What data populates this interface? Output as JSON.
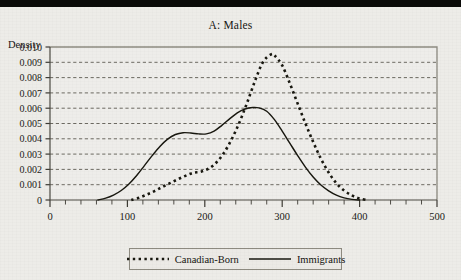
{
  "figure": {
    "title": "A: Males",
    "panel_label": "A",
    "panel_name": "Males",
    "background_color": "#edece8",
    "frame_color": "#8d8a80"
  },
  "axes": {
    "y_axis_title": "Density",
    "x_axis_title": "",
    "y_ticks": [
      "0.010",
      "0.009",
      "0.008",
      "0.007",
      "0.006",
      "0.005",
      "0.004",
      "0.003",
      "0.002",
      "0.001",
      "0"
    ],
    "x_ticks": [
      "0",
      "100",
      "200",
      "300",
      "400",
      "500"
    ]
  },
  "legend": {
    "position": "bottom-center",
    "entries": [
      {
        "label": "Canadian-Born",
        "style": "dotted",
        "color": "#18170f"
      },
      {
        "label": "Immigrants",
        "style": "solid",
        "color": "#18170f"
      }
    ]
  },
  "chart_data": {
    "type": "line",
    "title": "A: Males",
    "subtitle": "",
    "xlabel": "",
    "ylabel": "Density",
    "xlim": [
      0,
      500
    ],
    "ylim": [
      0,
      0.01
    ],
    "grid": true,
    "grid_style": "horizontal dashed gridlines at each 0.001",
    "x_major_step": 100,
    "x_minor_step": 20,
    "y_major_step": 0.001,
    "legend_position": "bottom-center",
    "series": [
      {
        "name": "Canadian-Born",
        "style": "dotted",
        "color": "#18170f",
        "x": [
          105,
          115,
          125,
          135,
          145,
          155,
          165,
          175,
          185,
          195,
          205,
          215,
          225,
          235,
          245,
          255,
          265,
          275,
          285,
          290,
          300,
          310,
          320,
          330,
          340,
          350,
          360,
          370,
          380,
          390,
          400,
          410
        ],
        "y": [
          0.0,
          0.00015,
          0.00035,
          0.00058,
          0.00085,
          0.0011,
          0.00135,
          0.00158,
          0.00178,
          0.00185,
          0.00205,
          0.00245,
          0.0031,
          0.004,
          0.0051,
          0.0064,
          0.0078,
          0.009,
          0.0095,
          0.00945,
          0.0088,
          0.0076,
          0.0063,
          0.005,
          0.0038,
          0.0027,
          0.0018,
          0.0011,
          0.00062,
          0.0003,
          0.0001,
          0.0
        ]
      },
      {
        "name": "Immigrants",
        "style": "solid",
        "color": "#18170f",
        "x": [
          62,
          72,
          82,
          92,
          102,
          112,
          122,
          132,
          142,
          152,
          162,
          172,
          182,
          192,
          202,
          212,
          222,
          232,
          242,
          252,
          262,
          270,
          280,
          290,
          300,
          310,
          320,
          330,
          340,
          350,
          360,
          370,
          380,
          390,
          400
        ],
        "y": [
          0.0,
          0.00012,
          0.00032,
          0.00062,
          0.00105,
          0.0016,
          0.00225,
          0.0029,
          0.0035,
          0.00398,
          0.00428,
          0.0044,
          0.00438,
          0.00432,
          0.00432,
          0.0045,
          0.00488,
          0.0053,
          0.0057,
          0.00595,
          0.00605,
          0.00602,
          0.0058,
          0.00525,
          0.0045,
          0.0037,
          0.0029,
          0.00215,
          0.0015,
          0.00098,
          0.0006,
          0.00032,
          0.00014,
          4e-05,
          0.0
        ]
      }
    ]
  }
}
